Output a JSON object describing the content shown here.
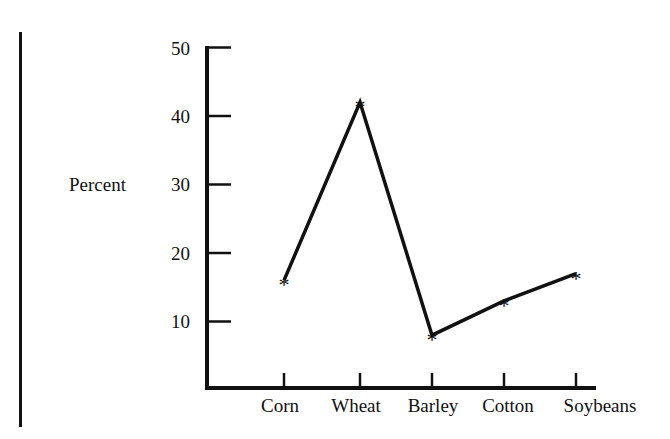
{
  "chart_data": {
    "type": "line",
    "title": "",
    "xlabel": "",
    "ylabel": "Percent",
    "categories": [
      "Corn",
      "Wheat",
      "Barley",
      "Cotton",
      "Soybeans"
    ],
    "values": [
      16,
      42,
      8,
      13,
      17
    ],
    "series": [
      {
        "name": "Percent",
        "values": [
          16,
          42,
          8,
          13,
          17
        ],
        "marker": "*"
      }
    ],
    "yticks": [
      10,
      20,
      30,
      40,
      50
    ],
    "ylim": [
      0,
      50
    ],
    "grid": false,
    "legend": null
  },
  "axis": {
    "ylabel": "Percent",
    "yticks": [
      "50",
      "40",
      "30",
      "20",
      "10"
    ],
    "categories": [
      "Corn",
      "Wheat",
      "Barley",
      "Cotton",
      "Soybeans"
    ]
  },
  "marker_glyph": "*",
  "colors": {
    "ink": "#111111",
    "background": "#ffffff"
  }
}
